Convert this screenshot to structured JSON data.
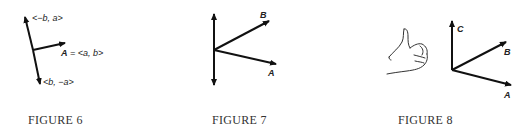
{
  "figures": [
    {
      "caption": "FIGURE 6",
      "labels": {
        "perp_up": "<−b, a>",
        "vector_a_name": "A",
        "vector_a_def": " = <a, b>",
        "perp_down": "<b, −a>"
      }
    },
    {
      "caption": "FIGURE 7",
      "labels": {
        "b": "B",
        "a": "A"
      }
    },
    {
      "caption": "FIGURE 8",
      "labels": {
        "c": "C",
        "b": "B",
        "a": "A"
      }
    }
  ],
  "colors": {
    "ink": "#111111",
    "caption": "#333333"
  }
}
